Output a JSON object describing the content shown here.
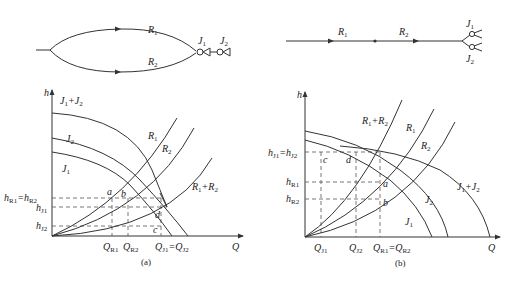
{
  "top_left": {
    "pipes": [
      {
        "name": "R",
        "sub": "1"
      },
      {
        "name": "R",
        "sub": "2"
      }
    ],
    "pumps": [
      {
        "name": "J",
        "sub": "1"
      },
      {
        "name": "J",
        "sub": "2"
      }
    ]
  },
  "top_right": {
    "pipes": [
      {
        "name": "R",
        "sub": "1"
      },
      {
        "name": "R",
        "sub": "2"
      }
    ],
    "pumps": [
      {
        "name": "J",
        "sub": "1"
      },
      {
        "name": "J",
        "sub": "2"
      }
    ]
  },
  "panel_a": {
    "caption": "(a)",
    "axis_y": "h",
    "axis_x": "Q",
    "curve_labels": {
      "j1j2": {
        "a": "J",
        "as": "1",
        "op": "+",
        "b": "J",
        "bs": "2"
      },
      "j2": {
        "a": "J",
        "as": "2"
      },
      "j1": {
        "a": "J",
        "as": "1"
      },
      "r1": {
        "a": "R",
        "as": "1"
      },
      "r2": {
        "a": "R",
        "as": "2"
      },
      "r1r2": {
        "a": "R",
        "as": "1",
        "op": "+",
        "b": "R",
        "bs": "2"
      }
    },
    "y_ticks": [
      {
        "a": "h",
        "as": "R1",
        "eq": "=",
        "b": "h",
        "bs": "R2"
      },
      {
        "a": "h",
        "as": "J1"
      },
      {
        "a": "h",
        "as": "J2"
      }
    ],
    "x_ticks": [
      {
        "a": "Q",
        "as": "R1"
      },
      {
        "a": "Q",
        "as": "R2"
      },
      {
        "a": "Q",
        "as": "J1",
        "eq": "=",
        "b": "Q",
        "bs": "J2"
      }
    ],
    "points": [
      "a",
      "b",
      "c",
      "d"
    ]
  },
  "panel_b": {
    "caption": "(b)",
    "axis_y": "h",
    "axis_x": "Q",
    "curve_labels": {
      "r1r2": {
        "a": "R",
        "as": "1",
        "op": "+",
        "b": "R",
        "bs": "2"
      },
      "r1": {
        "a": "R",
        "as": "1"
      },
      "r2": {
        "a": "R",
        "as": "2"
      },
      "j1j2": {
        "a": "J",
        "as": "1",
        "op": "+",
        "b": "J",
        "bs": "2"
      },
      "j2": {
        "a": "J",
        "as": "2"
      },
      "j1": {
        "a": "J",
        "as": "1"
      }
    },
    "y_ticks": [
      {
        "a": "h",
        "as": "J1",
        "eq": "=",
        "b": "h",
        "bs": "J2"
      },
      {
        "a": "h",
        "as": "R1"
      },
      {
        "a": "h",
        "as": "R2"
      }
    ],
    "x_ticks": [
      {
        "a": "Q",
        "as": "J1"
      },
      {
        "a": "Q",
        "as": "J2"
      },
      {
        "a": "Q",
        "as": "R1",
        "eq": "=",
        "b": "Q",
        "bs": "R2"
      }
    ],
    "points": [
      "a",
      "b",
      "c",
      "d"
    ]
  }
}
